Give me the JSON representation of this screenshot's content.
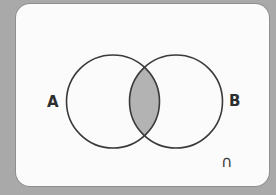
{
  "diagram": {
    "type": "venn",
    "sets": [
      {
        "label": "A",
        "position": "left"
      },
      {
        "label": "B",
        "position": "right"
      }
    ],
    "shaded_region": "A ∩ B",
    "operation_symbol": "∩",
    "colors": {
      "background": "#a9a9a9",
      "card": "#fbfbfb",
      "outline": "#3a3a3a",
      "shade": "#b3b3b3"
    }
  }
}
